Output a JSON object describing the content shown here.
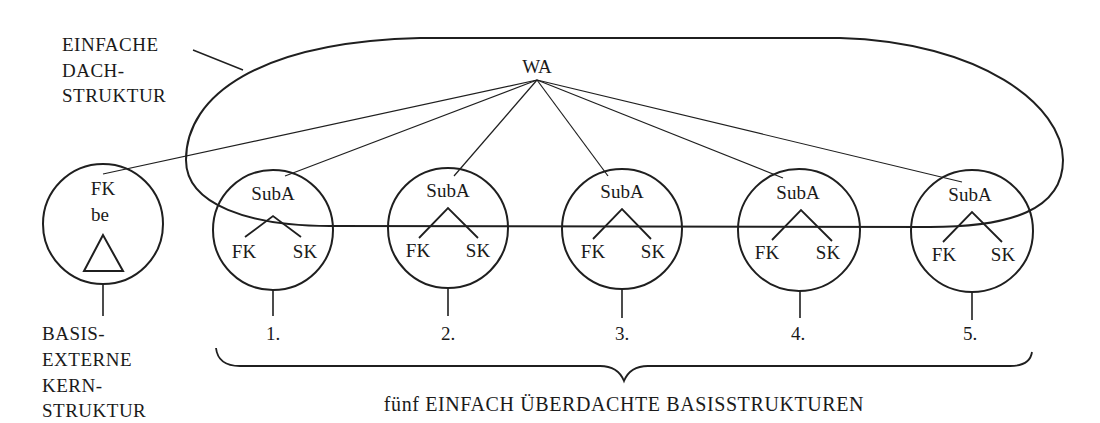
{
  "diagram": {
    "roof_label": [
      "EINFACHE",
      "DACH-",
      "STRUKTUR"
    ],
    "root_node": "WA",
    "external_structure": {
      "node_label": "FK",
      "sub_label": "be",
      "shape": "triangle",
      "caption": [
        "BASIS-",
        "EXTERNE",
        "KERN-",
        "STRUKTUR"
      ]
    },
    "base_structures": [
      {
        "index": "1.",
        "top": "SubA",
        "left": "FK",
        "right": "SK"
      },
      {
        "index": "2.",
        "top": "SubA",
        "left": "FK",
        "right": "SK"
      },
      {
        "index": "3.",
        "top": "SubA",
        "left": "FK",
        "right": "SK"
      },
      {
        "index": "4.",
        "top": "SubA",
        "left": "FK",
        "right": "SK"
      },
      {
        "index": "5.",
        "top": "SubA",
        "left": "FK",
        "right": "SK"
      }
    ],
    "brace_caption": "fünf EINFACH ÜBERDACHTE BASISSTRUKTUREN"
  }
}
